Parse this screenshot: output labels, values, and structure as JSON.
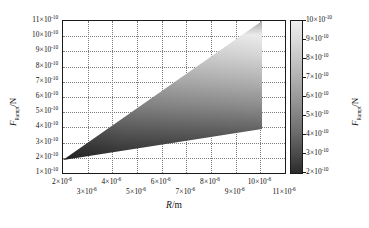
{
  "chart_data": {
    "type": "heatmap",
    "title": "",
    "xlabel": "R/m",
    "ylabel": "F_Rampt/N",
    "xlabel_parts": {
      "symbol": "R",
      "unit": "/m"
    },
    "ylabel_parts": {
      "symbol": "F",
      "subscript": "Rampt",
      "unit": "/N"
    },
    "xlim": [
      2e-06,
      1.1e-05
    ],
    "ylim": [
      1e-10,
      1.1e-09
    ],
    "grid": true,
    "colormap": "grayscale-inverted",
    "legend_position": "right-colorbar",
    "x_ticks_upper": [
      {
        "value": 2e-06,
        "mantissa": "2",
        "exponent": "-6"
      },
      {
        "value": 4e-06,
        "mantissa": "4",
        "exponent": "-6"
      },
      {
        "value": 6e-06,
        "mantissa": "6",
        "exponent": "-6"
      },
      {
        "value": 8e-06,
        "mantissa": "8",
        "exponent": "-6"
      },
      {
        "value": 1e-05,
        "mantissa": "10",
        "exponent": "-6"
      }
    ],
    "x_ticks_lower": [
      {
        "value": 3e-06,
        "mantissa": "3",
        "exponent": "-6"
      },
      {
        "value": 5e-06,
        "mantissa": "5",
        "exponent": "-6"
      },
      {
        "value": 7e-06,
        "mantissa": "7",
        "exponent": "-6"
      },
      {
        "value": 9e-06,
        "mantissa": "9",
        "exponent": "-6"
      },
      {
        "value": 1.1e-05,
        "mantissa": "11",
        "exponent": "-6"
      }
    ],
    "y_ticks": [
      {
        "value": 1.1e-09,
        "mantissa": "11",
        "exponent": "-10"
      },
      {
        "value": 1e-09,
        "mantissa": "10",
        "exponent": "-10"
      },
      {
        "value": 9e-10,
        "mantissa": "9",
        "exponent": "-10"
      },
      {
        "value": 8e-10,
        "mantissa": "8",
        "exponent": "-10"
      },
      {
        "value": 7e-10,
        "mantissa": "7",
        "exponent": "-10"
      },
      {
        "value": 6e-10,
        "mantissa": "6",
        "exponent": "-10"
      },
      {
        "value": 5e-10,
        "mantissa": "5",
        "exponent": "-10"
      },
      {
        "value": 4e-10,
        "mantissa": "4",
        "exponent": "-10"
      },
      {
        "value": 3e-10,
        "mantissa": "3",
        "exponent": "-10"
      },
      {
        "value": 2e-10,
        "mantissa": "2",
        "exponent": "-10"
      },
      {
        "value": 1e-10,
        "mantissa": "1",
        "exponent": "-10"
      }
    ],
    "colorbar": {
      "label": "F_Rampt/N",
      "min": 2e-10,
      "max": 1e-09,
      "ticks": [
        {
          "value": 1e-09,
          "mantissa": "10",
          "exponent": "-10"
        },
        {
          "value": 9e-10,
          "mantissa": "9",
          "exponent": "-10"
        },
        {
          "value": 8e-10,
          "mantissa": "8",
          "exponent": "-10"
        },
        {
          "value": 7e-10,
          "mantissa": "7",
          "exponent": "-10"
        },
        {
          "value": 6e-10,
          "mantissa": "6",
          "exponent": "-10"
        },
        {
          "value": 5e-10,
          "mantissa": "5",
          "exponent": "-10"
        },
        {
          "value": 4e-10,
          "mantissa": "4",
          "exponent": "-10"
        },
        {
          "value": 3e-10,
          "mantissa": "3",
          "exponent": "-10"
        },
        {
          "value": 2e-10,
          "mantissa": "2",
          "exponent": "-10"
        }
      ],
      "gradient_top_color": "#e9e9e9",
      "gradient_bottom_color": "#2b2b2b"
    },
    "region": {
      "description": "Filled wedge widening from apex at left to full vertical edge at right",
      "apex": {
        "x": 2e-06,
        "y": 2e-10
      },
      "upper_boundary": [
        {
          "x": 2e-06,
          "y": 2.2e-10
        },
        {
          "x": 1e-05,
          "y": 1.1e-09
        }
      ],
      "lower_boundary": [
        {
          "x": 2e-06,
          "y": 1.9e-10
        },
        {
          "x": 1e-05,
          "y": 4e-10
        }
      ],
      "shading": "value increases upward; dark at low values, light at high values"
    }
  }
}
